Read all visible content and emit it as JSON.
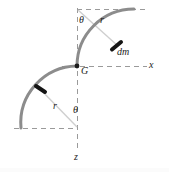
{
  "figure": {
    "canvas": {
      "width": 169,
      "height": 172,
      "background": "#ffffff"
    },
    "colors": {
      "curve": "#8c8c8c",
      "dashed": "#9a9a9a",
      "radius_line": "#c9c9c9",
      "label_text": "#1c1c1c",
      "mass_element_marker": "#141414"
    },
    "labels": {
      "theta_top": "θ",
      "r_top": "r",
      "mass_element": "dm",
      "centroid": "G",
      "x_axis": "x",
      "r_bottom": "r",
      "theta_bottom": "θ",
      "z_axis": "z"
    },
    "geometry": {
      "origin_G": {
        "x": 77,
        "y": 66
      },
      "radius_px": 57,
      "upper_arc": {
        "center": {
          "x": 77,
          "y": 9
        },
        "start": {
          "x": 77,
          "y": 66
        },
        "end": {
          "x": 134,
          "y": 9
        },
        "sweep_deg": 90
      },
      "lower_arc": {
        "center": {
          "x": 77,
          "y": 128
        },
        "start": {
          "x": 77,
          "y": 66
        },
        "end": {
          "x": 22,
          "y": 128
        },
        "sweep_deg": 90
      },
      "mass_element_point": {
        "x": 117,
        "y": 45
      },
      "radius_line_upper": {
        "x1": 77,
        "y1": 9,
        "x2": 117,
        "y2": 45
      },
      "radius_line_lower": {
        "x1": 77,
        "y1": 128,
        "x2": 41,
        "y2": 90
      },
      "axis_z_vertical": {
        "x": 77,
        "y1": 9,
        "y2": 152
      },
      "axis_x_horizontal": {
        "y": 66,
        "x1": 62,
        "x2": 147
      },
      "dashed_top_horizontal": {
        "y": 9,
        "x1": 77,
        "x2": 146
      },
      "dashed_bottom_horizontal": {
        "y": 128,
        "x1": 14,
        "x2": 77
      }
    }
  }
}
